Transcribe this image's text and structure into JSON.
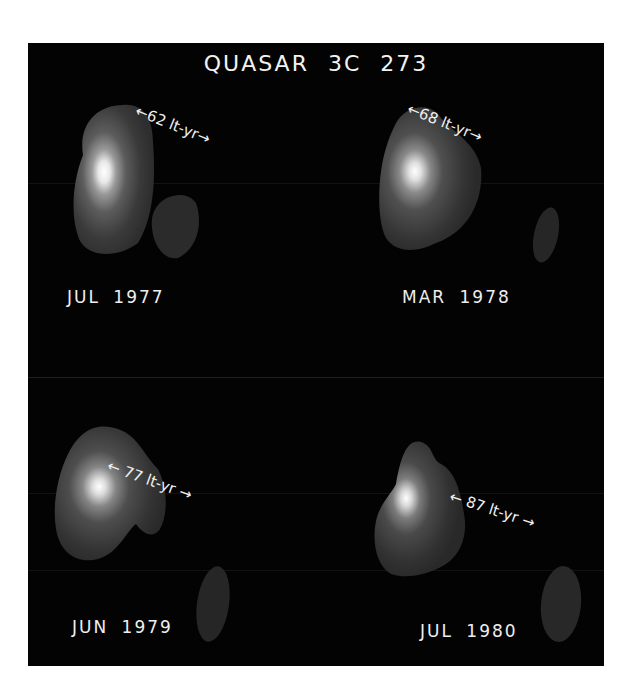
{
  "figure": {
    "title": "QUASAR  3C 273",
    "background_color": "#030303",
    "page_color": "#ffffff",
    "text_color": "#f0f0f0",
    "epochs": [
      {
        "date": "JUL 1977",
        "separation": "62 lt-yr",
        "separation_value": 62,
        "separation_unit": "lt-yr",
        "scale_label": "←62 lt-yr→"
      },
      {
        "date": "MAR 1978",
        "separation": "68 lt-yr",
        "separation_value": 68,
        "separation_unit": "lt-yr",
        "scale_label": "←68 lt-yr→"
      },
      {
        "date": "JUN 1979",
        "separation": "77 lt-yr",
        "separation_value": 77,
        "separation_unit": "lt-yr",
        "scale_label": "← 77 lt-yr →"
      },
      {
        "date": "JUL 1980",
        "separation": "87 lt-yr",
        "separation_value": 87,
        "separation_unit": "lt-yr",
        "scale_label": "← 87 lt-yr →"
      }
    ]
  }
}
